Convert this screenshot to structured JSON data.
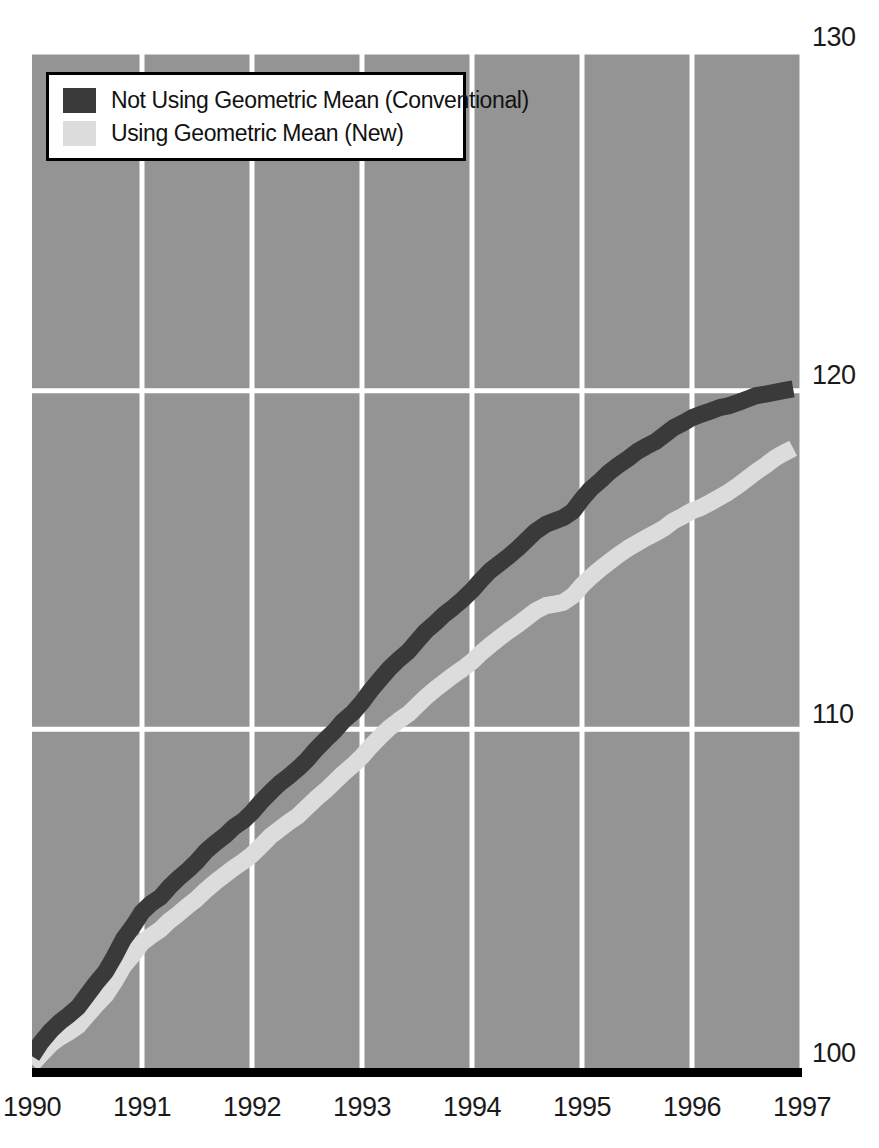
{
  "figure": {
    "background_color": "#ffffff",
    "plot_background_color": "#949494",
    "gridline_color": "#ffffff",
    "axis_color": "#000000",
    "cropped_header_text": ""
  },
  "legend": {
    "position": "top-left-inside",
    "border_color": "#000000",
    "background_color": "#ffffff",
    "entries": [
      {
        "label": "Not Using Geometric Mean (Conventional)",
        "color": "#3a3a3a",
        "swatch_name": "legend-swatch-conventional"
      },
      {
        "label": "Using Geometric Mean (New)",
        "color": "#dcdcdc",
        "swatch_name": "legend-swatch-geometric"
      }
    ]
  },
  "axes": {
    "y_ticks": [
      "100",
      "110",
      "120",
      "130"
    ],
    "y_tick_130": "130",
    "y_tick_120": "120",
    "y_tick_110": "110",
    "y_tick_100": "100",
    "x_ticks": [
      "1990",
      "1991",
      "1992",
      "1993",
      "1994",
      "1995",
      "1996",
      "1997"
    ]
  },
  "chart_data": {
    "type": "line",
    "title": "",
    "subtitle": "",
    "xlabel": "",
    "ylabel": "",
    "xlim": [
      1990.0,
      1997.0
    ],
    "ylim": [
      100,
      130
    ],
    "ytick_values": [
      100,
      110,
      120,
      130
    ],
    "xtick_values": [
      1990,
      1991,
      1992,
      1993,
      1994,
      1995,
      1996,
      1997
    ],
    "grid": true,
    "grid_orientation": "both",
    "legend_position": "upper left",
    "index_base": 100,
    "x": [
      1990.0,
      1990.08,
      1990.17,
      1990.25,
      1990.33,
      1990.42,
      1990.5,
      1990.58,
      1990.67,
      1990.75,
      1990.83,
      1990.92,
      1991.0,
      1991.08,
      1991.17,
      1991.25,
      1991.33,
      1991.42,
      1991.5,
      1991.58,
      1991.67,
      1991.75,
      1991.83,
      1991.92,
      1992.0,
      1992.08,
      1992.17,
      1992.25,
      1992.33,
      1992.42,
      1992.5,
      1992.58,
      1992.67,
      1992.75,
      1992.83,
      1992.92,
      1993.0,
      1993.08,
      1993.17,
      1993.25,
      1993.33,
      1993.42,
      1993.5,
      1993.58,
      1993.67,
      1993.75,
      1993.83,
      1993.92,
      1994.0,
      1994.08,
      1994.17,
      1994.25,
      1994.33,
      1994.42,
      1994.5,
      1994.58,
      1994.67,
      1994.75,
      1994.83,
      1994.92,
      1995.0,
      1995.08,
      1995.17,
      1995.25,
      1995.33,
      1995.42,
      1995.5,
      1995.58,
      1995.67,
      1995.75,
      1995.83,
      1995.92,
      1996.0,
      1996.08,
      1996.17,
      1996.25,
      1996.33,
      1996.42,
      1996.5,
      1996.58,
      1996.67,
      1996.75,
      1996.83,
      1996.92
    ],
    "series": [
      {
        "name": "Not Using Geometric Mean (Conventional)",
        "color": "#3a3a3a",
        "values": [
          100.35,
          100.75,
          101.1,
          101.35,
          101.55,
          101.8,
          102.15,
          102.5,
          102.85,
          103.3,
          103.8,
          104.2,
          104.6,
          104.85,
          105.05,
          105.35,
          105.6,
          105.85,
          106.1,
          106.4,
          106.65,
          106.85,
          107.1,
          107.3,
          107.55,
          107.85,
          108.15,
          108.4,
          108.6,
          108.85,
          109.1,
          109.4,
          109.7,
          109.95,
          110.25,
          110.5,
          110.8,
          111.15,
          111.5,
          111.8,
          112.05,
          112.3,
          112.6,
          112.9,
          113.15,
          113.4,
          113.6,
          113.85,
          114.1,
          114.4,
          114.7,
          114.9,
          115.1,
          115.35,
          115.6,
          115.85,
          116.05,
          116.15,
          116.25,
          116.45,
          116.8,
          117.1,
          117.35,
          117.6,
          117.8,
          118.0,
          118.2,
          118.35,
          118.5,
          118.7,
          118.9,
          119.05,
          119.2,
          119.3,
          119.4,
          119.5,
          119.55,
          119.65,
          119.75,
          119.85,
          119.9,
          119.95,
          120.0,
          120.05
        ]
      },
      {
        "name": "Using Geometric Mean (New)",
        "color": "#dcdcdc",
        "values": [
          100.1,
          100.4,
          100.7,
          100.9,
          101.05,
          101.25,
          101.55,
          101.85,
          102.15,
          102.55,
          103.0,
          103.35,
          103.7,
          103.9,
          104.1,
          104.35,
          104.55,
          104.8,
          105.0,
          105.25,
          105.5,
          105.7,
          105.9,
          106.1,
          106.3,
          106.55,
          106.85,
          107.05,
          107.25,
          107.45,
          107.7,
          107.95,
          108.2,
          108.45,
          108.7,
          108.95,
          109.2,
          109.5,
          109.8,
          110.05,
          110.25,
          110.45,
          110.7,
          110.95,
          111.2,
          111.4,
          111.6,
          111.8,
          112.0,
          112.25,
          112.5,
          112.7,
          112.9,
          113.1,
          113.3,
          113.5,
          113.65,
          113.7,
          113.75,
          113.95,
          114.25,
          114.5,
          114.75,
          114.95,
          115.15,
          115.35,
          115.5,
          115.65,
          115.8,
          115.95,
          116.15,
          116.3,
          116.45,
          116.55,
          116.7,
          116.85,
          117.0,
          117.2,
          117.4,
          117.6,
          117.8,
          118.0,
          118.15,
          118.3
        ]
      }
    ]
  }
}
